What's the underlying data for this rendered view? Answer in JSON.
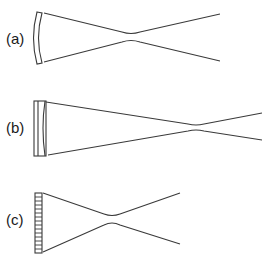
{
  "figure": {
    "panels": [
      {
        "id": "a",
        "label": "(a)",
        "optic": "curved-mirror"
      },
      {
        "id": "b",
        "label": "(b)",
        "optic": "flat-plate-with-curved-surface"
      },
      {
        "id": "c",
        "label": "(c)",
        "optic": "segmented-array"
      }
    ],
    "colors": {
      "line": "#3a3a3a",
      "background": "#ffffff"
    }
  }
}
